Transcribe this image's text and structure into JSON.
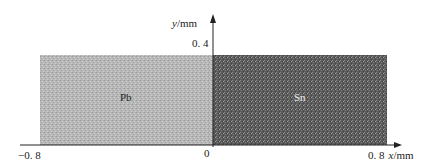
{
  "diagram": {
    "regions": [
      {
        "label": "Pb",
        "x_range": [
          -0.8,
          0
        ],
        "y_range": [
          0,
          0.4
        ],
        "fill": "#b4b4b4"
      },
      {
        "label": "Sn",
        "x_range": [
          0,
          0.8
        ],
        "y_range": [
          0,
          0.4
        ],
        "fill": "#5a5a5a"
      }
    ],
    "axes": {
      "x_label_var": "x",
      "x_label_unit": "/mm",
      "y_label_var": "y",
      "y_label_unit": "/mm",
      "origin_label": "0",
      "x_min_label": "−0. 8",
      "x_max_label": "0. 8",
      "y_max_label": "0. 4"
    }
  }
}
